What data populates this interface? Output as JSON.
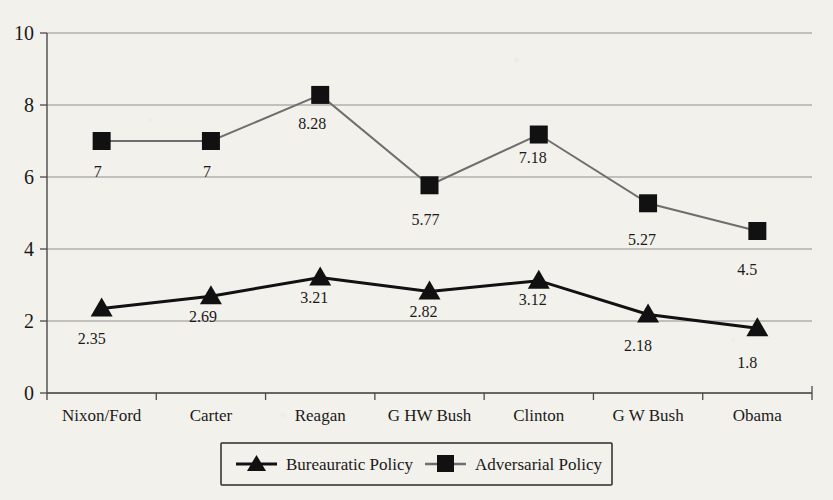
{
  "chart_data": {
    "type": "line",
    "title": "",
    "subtitle": "",
    "xlabel": "",
    "ylabel": "",
    "categories": [
      "Nixon/Ford",
      "Carter",
      "Reagan",
      "G HW Bush",
      "Clinton",
      "G W Bush",
      "Obama"
    ],
    "ylim": [
      0,
      10
    ],
    "yticks": [
      "0",
      "2",
      "4",
      "6",
      "8",
      "10"
    ],
    "ytick_values": [
      0,
      2,
      4,
      6,
      8,
      10
    ],
    "grid": true,
    "legend_position": "bottom-center",
    "series": [
      {
        "name": "Bureauratic Policy",
        "marker": "triangle",
        "color": "#111111",
        "line_width": 3,
        "values": [
          2.35,
          2.69,
          3.21,
          2.82,
          3.12,
          2.18,
          1.8
        ],
        "value_labels": [
          "2.35",
          "2.69",
          "3.21",
          "2.82",
          "3.12",
          "2.18",
          "1.8"
        ]
      },
      {
        "name": "Adversarial Policy",
        "marker": "square",
        "color": "#6e6e6e",
        "line_width": 2,
        "values": [
          7,
          7,
          8.28,
          5.77,
          7.18,
          5.27,
          4.5
        ],
        "value_labels": [
          "7",
          "7",
          "8.28",
          "5.77",
          "7.18",
          "5.27",
          "4.5"
        ]
      }
    ]
  },
  "legend": {
    "entries": [
      {
        "label": "Bureauratic Policy",
        "marker": "triangle-marker"
      },
      {
        "label": "Adversarial Policy",
        "marker": "square-marker"
      }
    ]
  }
}
